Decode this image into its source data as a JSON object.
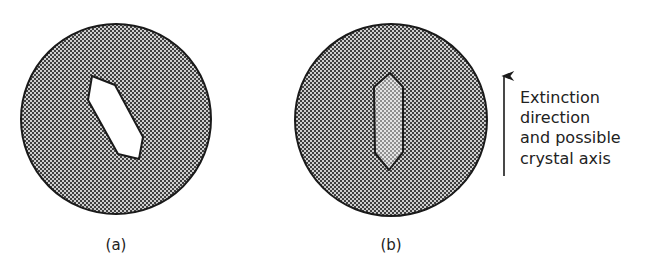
{
  "figure": {
    "panels": [
      {
        "id": "a",
        "label": "(a)",
        "circle": {
          "cx": 116,
          "cy": 119,
          "r": 95
        },
        "crystal_fill": "white",
        "crystal_description": "bright elongated hexagonal crystal, inclined to extinction direction"
      },
      {
        "id": "b",
        "label": "(b)",
        "circle": {
          "cx": 391,
          "cy": 120,
          "r": 96
        },
        "crystal_fill": "light-stipple",
        "crystal_description": "elongated hexagonal crystal, vertical, at extinction"
      }
    ],
    "annotation": {
      "arrow_icon": "up-arrow-icon",
      "lines": [
        "Extinction",
        "direction",
        "and possible",
        "crystal axis"
      ]
    },
    "colors": {
      "outline": "#1a1a1a",
      "dark_stipple": "#444444",
      "light_stipple": "#cfcfcf",
      "crystal_b_dark": "#8a8a8a",
      "crystal_b_light": "#e2e2e2",
      "background": "#ffffff"
    }
  }
}
